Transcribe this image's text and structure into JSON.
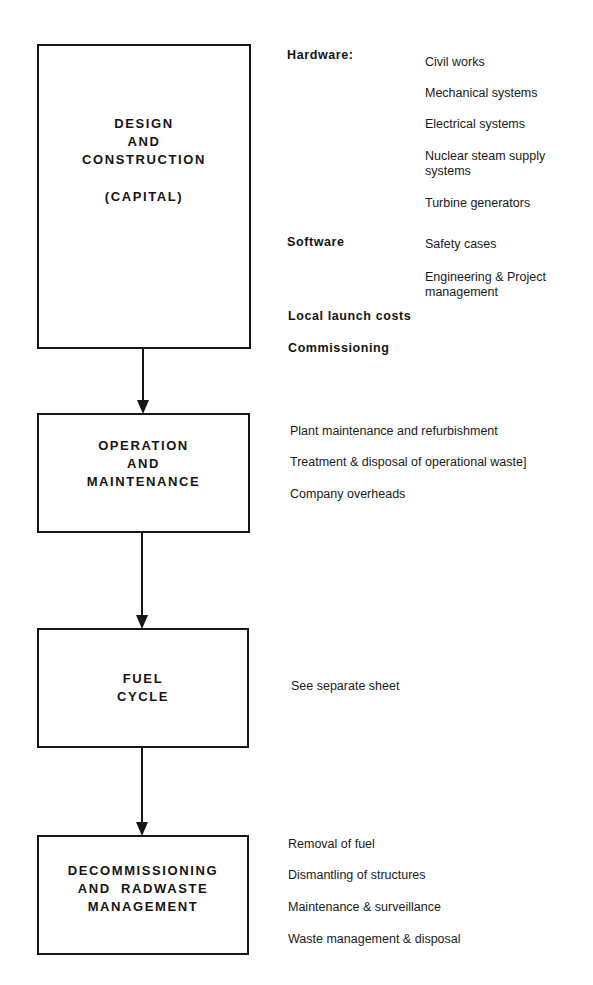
{
  "stages": [
    {
      "id": "design",
      "title_lines": [
        "DESIGN",
        "AND",
        "CONSTRUCTION",
        "",
        "(CAPITAL)"
      ],
      "categories": [
        {
          "label": "Hardware:",
          "items": [
            "Civil works",
            "Mechanical systems",
            "Electrical systems",
            "Nuclear steam supply",
            "systems",
            "Turbine generators"
          ]
        },
        {
          "label": "Software",
          "items": [
            "Safety cases",
            "Engineering & Project",
            "management"
          ]
        },
        {
          "label": "Local launch costs",
          "items": []
        },
        {
          "label": "Commissioning",
          "items": []
        }
      ]
    },
    {
      "id": "operation",
      "title_lines": [
        "OPERATION",
        "AND",
        "MAINTENANCE"
      ],
      "items": [
        "Plant maintenance and refurbishment",
        "Treatment & disposal of operational waste]",
        "Company overheads"
      ]
    },
    {
      "id": "fuel",
      "title_lines": [
        "FUEL",
        "CYCLE"
      ],
      "items": [
        "See separate sheet"
      ]
    },
    {
      "id": "decommissioning",
      "title_lines": [
        "DECOMMISSIONING",
        "AND  RADWASTE",
        "MANAGEMENT"
      ],
      "items": [
        "Removal of fuel",
        "Dismantling of structures",
        "Maintenance & surveillance",
        "Waste management & disposal"
      ]
    }
  ],
  "colors": {
    "line": "#161616",
    "text": "#141414",
    "background": "#ffffff"
  }
}
